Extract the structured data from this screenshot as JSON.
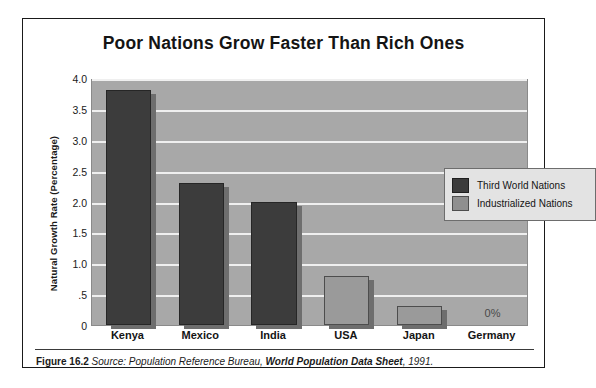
{
  "figure": {
    "title": "Poor Nations Grow Faster Than Rich Ones",
    "caption": {
      "figure_number": "Figure 16.2",
      "source_intro": "Source: Population Reference Bureau,",
      "publication": " World Population Data Sheet",
      "year": ", 1991."
    }
  },
  "legend": {
    "position": "inside-top-right",
    "items": [
      {
        "label": "Third World Nations",
        "color": "#3c3c3c"
      },
      {
        "label": "Industrialized Nations",
        "color": "#8f8f8f"
      }
    ]
  },
  "colors": {
    "plot_background": "#a8a8a8",
    "gridline": "#efefef",
    "third_world_bar": "#3c3c3c",
    "industrialized_bar": "#9a9a9a",
    "bar_shadow": "#6e6e6e",
    "frame": "#1a1a1a",
    "legend_background": "#e3e3e3"
  },
  "chart_data": {
    "type": "bar",
    "title": "Poor Nations Grow Faster Than Rich Ones",
    "xlabel": "",
    "ylabel": "Natural Growth Rate (Percentage)",
    "ylim": [
      0,
      4.0
    ],
    "yticks": [
      0,
      0.5,
      1.0,
      1.5,
      2.0,
      2.5,
      3.0,
      3.5,
      4.0
    ],
    "ytick_labels": [
      "0",
      ".5",
      "1.0",
      "1.5",
      "2.0",
      "2.5",
      "3.0",
      "3.5",
      "4.0"
    ],
    "grid": true,
    "grid_axis": "y",
    "categories": [
      "Kenya",
      "Mexico",
      "India",
      "USA",
      "Japan",
      "Germany"
    ],
    "values": [
      3.8,
      2.3,
      2.0,
      0.8,
      0.3,
      0.0
    ],
    "group_of": [
      "Third World Nations",
      "Third World Nations",
      "Third World Nations",
      "Industrialized Nations",
      "Industrialized Nations",
      "Industrialized Nations"
    ],
    "annotations": [
      {
        "category": "Germany",
        "text": "0%"
      }
    ],
    "legend": [
      "Third World Nations",
      "Industrialized Nations"
    ]
  }
}
